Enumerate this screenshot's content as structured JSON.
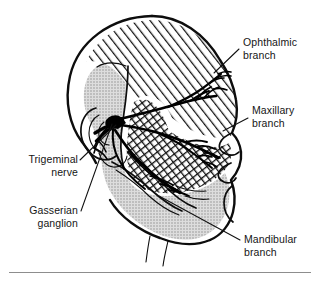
{
  "figure": {
    "background_color": "#ffffff",
    "ink_color": "#0d0d0d",
    "footer_rule": true
  },
  "labels": [
    {
      "id": "ophthalmic",
      "line1": "Ophthalmic",
      "line2": "branch",
      "anchor": "start",
      "x": 243,
      "y": 46,
      "leader": "M 239 49 L 214 73"
    },
    {
      "id": "maxillary",
      "line1": "Maxillary",
      "line2": "branch",
      "anchor": "start",
      "x": 252,
      "y": 114,
      "leader": "M 248 118 L 223 131"
    },
    {
      "id": "trigeminal-nerve",
      "line1": "Trigeminal",
      "line2": "nerve",
      "anchor": "end",
      "x": 78,
      "y": 163,
      "leader": "M 80 160 L 116 125"
    },
    {
      "id": "gasserian-ganglion",
      "line1": "Gasserian",
      "line2": "ganglion",
      "anchor": "end",
      "x": 78,
      "y": 214,
      "leader": "M 81 211 L 112 124"
    },
    {
      "id": "mandibular",
      "line1": "Mandibular",
      "line2": "branch",
      "anchor": "start",
      "x": 244,
      "y": 243,
      "leader": "M 240 240 L 159 196"
    }
  ],
  "regions": [
    {
      "id": "ophthalmic-territory",
      "name": "Ophthalmic branch territory",
      "pattern": "diagonal-hatch",
      "pattern_color": "#111111",
      "fill_color": "#ffffff"
    },
    {
      "id": "maxillary-territory",
      "name": "Maxillary branch territory",
      "pattern": "cross-hatch",
      "pattern_color": "#111111",
      "fill_color": "#ffffff"
    },
    {
      "id": "mandibular-territory",
      "name": "Mandibular branch territory",
      "pattern": "stipple",
      "pattern_color": "#9a9a9a",
      "fill_color": "#d9d9d9"
    }
  ],
  "anatomy": [
    {
      "id": "head-profile",
      "name": "Head and face profile outline"
    },
    {
      "id": "ear",
      "name": "Auricle (outer ear)"
    },
    {
      "id": "ganglion-node",
      "name": "Gasserian (trigeminal) ganglion"
    },
    {
      "id": "nerve-trunk",
      "name": "Trigeminal nerve trunk"
    },
    {
      "id": "ophthalmic-nerve-branches",
      "name": "Ophthalmic nerve branches"
    },
    {
      "id": "maxillary-nerve-branches",
      "name": "Maxillary nerve branches"
    },
    {
      "id": "mandibular-nerve-branches",
      "name": "Mandibular nerve branches"
    }
  ]
}
